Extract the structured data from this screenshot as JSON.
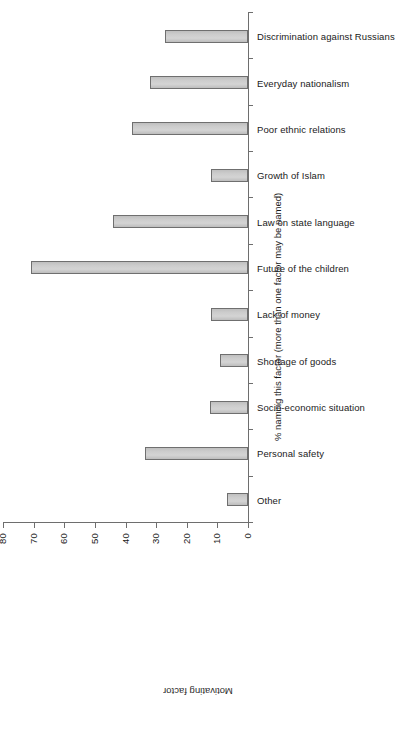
{
  "chart_data": {
    "type": "bar",
    "title": "",
    "orientation": "vertical-bars-rotated-90ccw",
    "xlabel": "Motivating factor",
    "ylabel": "% naming this factor (more than one factor may be named)",
    "ylim": [
      0,
      80
    ],
    "yticks": [
      0,
      10,
      20,
      30,
      40,
      50,
      60,
      70,
      80
    ],
    "grid": false,
    "legend": false,
    "categories": [
      "Other",
      "Personal safety",
      "Socio-economic situation",
      "Shortage of goods",
      "Lack of money",
      "Future of the children",
      "Law on state language",
      "Growth of Islam",
      "Poor ethnic relations",
      "Everyday nationalism",
      "Discrimination against Russians"
    ],
    "values": [
      7,
      33.5,
      12.5,
      9,
      12,
      71,
      44,
      12,
      38,
      32,
      27
    ],
    "bar_color": "#c9c9c9",
    "bar_edge_color": "#6f6f6f",
    "axis_color": "#6e6e6e"
  },
  "axes": {
    "value_axis_name": "percent-axis",
    "category_axis_name": "motivating-factor-axis",
    "value_axis_title": "% naming this factor (more than one factor may be named)",
    "category_axis_title": "Motivating factor",
    "tick_labels": [
      "0",
      "10",
      "20",
      "30",
      "40",
      "50",
      "60",
      "70",
      "80"
    ]
  }
}
